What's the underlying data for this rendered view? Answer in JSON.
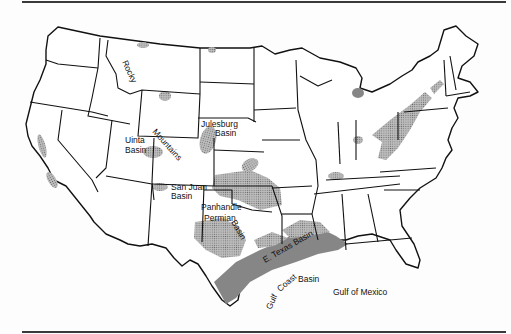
{
  "map": {
    "type": "outline map",
    "region": "Contiguous United States",
    "style": "black state outlines, stippled gray shading for basin areas",
    "colors": {
      "outline": "#111111",
      "shading": "#9a9a9a",
      "background": "#fdfdfd"
    },
    "labels": {
      "rocky": "Rocky",
      "mountains": "Mountains",
      "uinta_1": "Uinta",
      "uinta_2": "Basin",
      "julesburg_1": "Julesburg",
      "julesburg_2": "Basin",
      "san_juan_1": "San Juan",
      "san_juan_2": "Basin",
      "panhandle": "Panhandle",
      "permian": "Permian",
      "permian_basin": "Basin",
      "e_texas": "E. Texas Basin",
      "gulf_coast_1": "Gulf",
      "gulf_coast_2": "Coast",
      "gulf_coast_3": "Basin",
      "gulf_of_mexico": "Gulf of Mexico"
    }
  }
}
